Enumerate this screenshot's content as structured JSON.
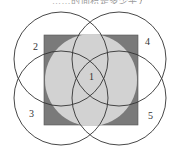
{
  "caption": "……的面积是多少平方厘米",
  "diagram": {
    "type": "geometry-figure",
    "square": {
      "x": 44,
      "y": 35,
      "w": 94,
      "h": 90,
      "fill": "#7a7a7a"
    },
    "center_circle": {
      "cx": 91,
      "cy": 80,
      "r": 46,
      "fill": "#d2d2d2"
    },
    "circles": [
      {
        "id": "2",
        "cx": 61,
        "cy": 59,
        "r": 47
      },
      {
        "id": "4",
        "cx": 119,
        "cy": 59,
        "r": 47
      },
      {
        "id": "3",
        "cx": 61,
        "cy": 98,
        "r": 47
      },
      {
        "id": "5",
        "cx": 119,
        "cy": 98,
        "r": 47
      }
    ],
    "labels": [
      {
        "text": "1",
        "x": 89,
        "y": 80
      },
      {
        "text": "2",
        "x": 33,
        "y": 50
      },
      {
        "text": "4",
        "x": 145,
        "y": 45
      },
      {
        "text": "3",
        "x": 29,
        "y": 117
      },
      {
        "text": "5",
        "x": 148,
        "y": 119
      }
    ],
    "stroke": "#333333"
  }
}
